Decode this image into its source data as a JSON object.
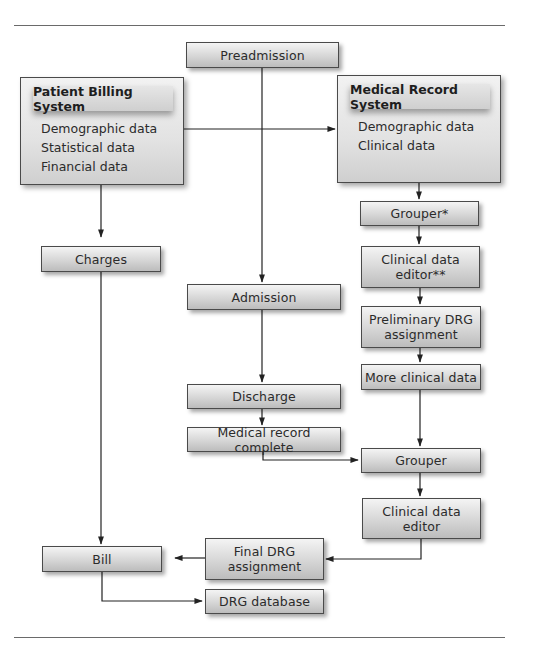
{
  "diagram": {
    "patient_billing_system": {
      "title": "Patient Billing System",
      "items": [
        "Demographic data",
        "Statistical data",
        "Financial data"
      ]
    },
    "medical_record_system": {
      "title": "Medical Record System",
      "items": [
        "Demographic data",
        "Clinical data"
      ]
    },
    "nodes": {
      "preadmission": "Preadmission",
      "charges": "Charges",
      "admission": "Admission",
      "discharge": "Discharge",
      "medical_record_complete": "Medical record complete",
      "grouper_star": "Grouper*",
      "clinical_data_editor_2star": "Clinical data editor**",
      "preliminary_drg": "Preliminary DRG assignment",
      "more_clinical_data": "More clinical data",
      "grouper": "Grouper",
      "clinical_data_editor": "Clinical data editor",
      "final_drg": "Final DRG assignment",
      "bill": "Bill",
      "drg_database": "DRG database"
    },
    "edges": [
      {
        "from": "Preadmission",
        "to": "Admission"
      },
      {
        "from": "Patient Billing System",
        "to": "Medical Record System"
      },
      {
        "from": "Patient Billing System",
        "to": "Charges"
      },
      {
        "from": "Charges",
        "to": "Bill"
      },
      {
        "from": "Medical Record System",
        "to": "Grouper*"
      },
      {
        "from": "Grouper*",
        "to": "Clinical data editor**"
      },
      {
        "from": "Clinical data editor**",
        "to": "Preliminary DRG assignment"
      },
      {
        "from": "Preliminary DRG assignment",
        "to": "More clinical data"
      },
      {
        "from": "More clinical data",
        "to": "Grouper"
      },
      {
        "from": "Admission",
        "to": "Discharge"
      },
      {
        "from": "Discharge",
        "to": "Medical record complete"
      },
      {
        "from": "Medical record complete",
        "to": "Grouper"
      },
      {
        "from": "Grouper",
        "to": "Clinical data editor"
      },
      {
        "from": "Clinical data editor",
        "to": "Final DRG assignment"
      },
      {
        "from": "Final DRG assignment",
        "to": "Bill"
      },
      {
        "from": "Bill",
        "to": "DRG database"
      }
    ]
  }
}
